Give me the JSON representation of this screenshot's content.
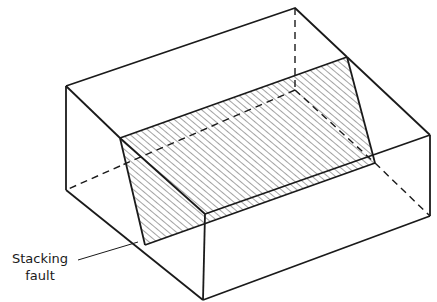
{
  "figure": {
    "label": {
      "line1": "Stacking",
      "line2": "fault"
    },
    "colors": {
      "stroke": "#1a1a1a",
      "hatch": "#444444",
      "background": "#ffffff"
    }
  }
}
